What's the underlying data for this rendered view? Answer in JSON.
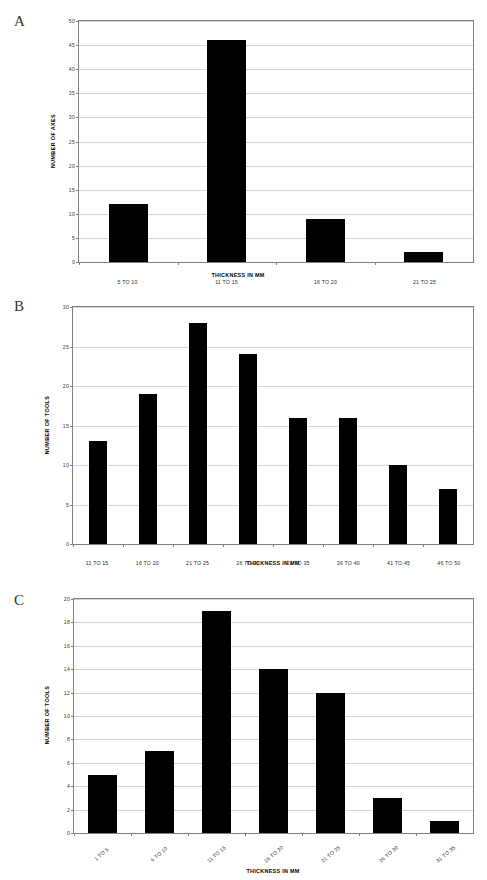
{
  "figure": {
    "panels": [
      {
        "letter": "A",
        "ylabel": "NUMBER OF AXES",
        "xlabel": "THICKNESS IN MM",
        "categories": [
          "5 TO 10",
          "11 TO 15",
          "16 TO 20",
          "21 TO 25"
        ],
        "values": [
          12,
          46,
          9,
          2
        ],
        "yticks": [
          0,
          5,
          10,
          15,
          20,
          25,
          30,
          35,
          40,
          45,
          50
        ]
      },
      {
        "letter": "B",
        "ylabel": "NUMBER OF TOOLS",
        "xlabel": "THICKNESS IN MM",
        "categories": [
          "11 TO 15",
          "16 TO 20",
          "21 TO 25",
          "26 TO 30",
          "31 TO 35",
          "36 TO 40",
          "41 TO 45",
          "46 TO 50"
        ],
        "values": [
          13,
          19,
          28,
          24,
          16,
          16,
          10,
          7
        ],
        "yticks": [
          0,
          5,
          10,
          15,
          20,
          25,
          30
        ]
      },
      {
        "letter": "C",
        "ylabel": "NUMBER OF TOOLS",
        "xlabel": "THICKNESS IN MM",
        "categories": [
          "1 TO 5",
          "6 TO 10",
          "11 TO 15",
          "16 TO 20",
          "21 TO 25",
          "26 TO 30",
          "31 TO 35"
        ],
        "values": [
          5,
          7,
          19,
          14,
          12,
          3,
          1
        ],
        "yticks": [
          0,
          2,
          4,
          6,
          8,
          10,
          12,
          14,
          16,
          18,
          20
        ]
      }
    ]
  },
  "chart_data": [
    {
      "type": "bar",
      "title": "A",
      "categories": [
        "5 TO 10",
        "11 TO 15",
        "16 TO 20",
        "21 TO 25"
      ],
      "values": [
        12,
        46,
        9,
        2
      ],
      "xlabel": "THICKNESS IN MM",
      "ylabel": "NUMBER OF AXES",
      "ylim": [
        0,
        50
      ],
      "ytick_step": 5,
      "grid": true,
      "legend": "none",
      "bar_color": "#000000"
    },
    {
      "type": "bar",
      "title": "B",
      "categories": [
        "11 TO 15",
        "16 TO 20",
        "21 TO 25",
        "26 TO 30",
        "31 TO 35",
        "36 TO 40",
        "41 TO 45",
        "46 TO 50"
      ],
      "values": [
        13,
        19,
        28,
        24,
        16,
        16,
        10,
        7
      ],
      "xlabel": "THICKNESS IN MM",
      "ylabel": "NUMBER OF TOOLS",
      "ylim": [
        0,
        30
      ],
      "ytick_step": 5,
      "grid": true,
      "legend": "none",
      "bar_color": "#000000"
    },
    {
      "type": "bar",
      "title": "C",
      "categories": [
        "1 TO 5",
        "6 TO 10",
        "11 TO 15",
        "16 TO 20",
        "21 TO 25",
        "26 TO 30",
        "31 TO 35"
      ],
      "values": [
        5,
        7,
        19,
        14,
        12,
        3,
        1
      ],
      "xlabel": "THICKNESS IN MM",
      "ylabel": "NUMBER OF TOOLS",
      "ylim": [
        0,
        20
      ],
      "ytick_step": 2,
      "grid": true,
      "legend": "none",
      "bar_color": "#000000"
    }
  ]
}
